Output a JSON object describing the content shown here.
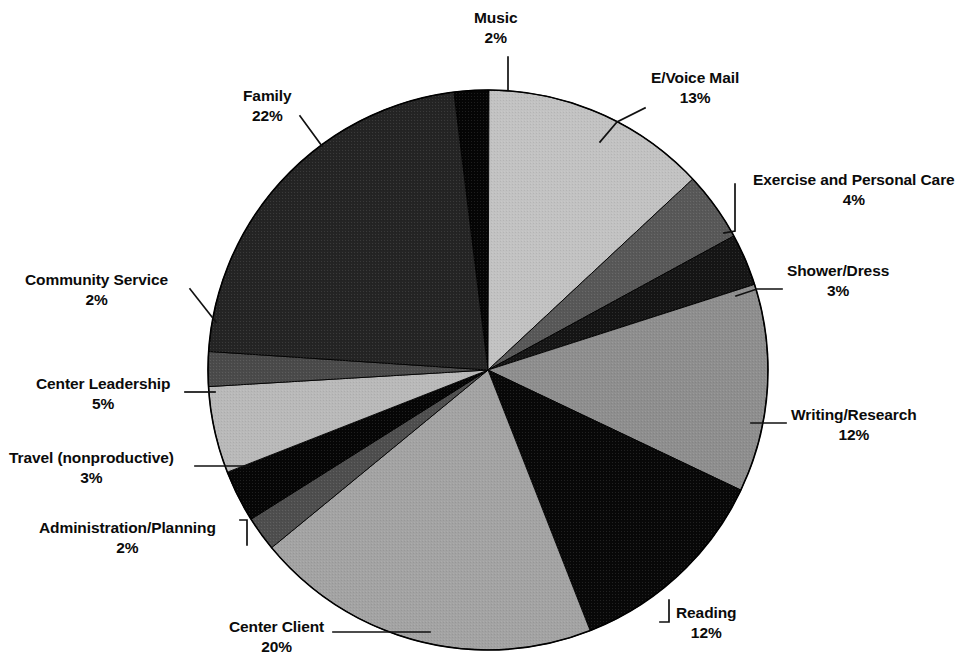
{
  "chart_data": {
    "type": "pie",
    "title": "",
    "subtitle": "",
    "xlabel": "",
    "ylabel": "",
    "legend_position": "none",
    "grid": false,
    "labels_show_percent": true,
    "total_percent": 100,
    "center": {
      "x": 488,
      "y": 370
    },
    "radius": 280,
    "start_angle_deg": -97,
    "direction": "clockwise",
    "categories": [
      "Music",
      "E/Voice Mail",
      "Exercise and Personal Care",
      "Shower/Dress",
      "Writing/Research",
      "Reading",
      "Center Client",
      "Administration/Planning",
      "Travel (nonproductive)",
      "Center Leadership",
      "Community Service",
      "Family"
    ],
    "values": [
      2,
      13,
      4,
      3,
      12,
      12,
      20,
      2,
      3,
      5,
      2,
      22
    ],
    "colors": [
      "#050505",
      "#c2c2c2",
      "#585858",
      "#151515",
      "#8e8e8e",
      "#080808",
      "#a3a3a3",
      "#4e4e4e",
      "#060606",
      "#b9b9b9",
      "#4a4a4a",
      "#242424"
    ],
    "slices": [
      {
        "label": "Music",
        "percent_text": "2%",
        "value": 2,
        "color": "#050505"
      },
      {
        "label": "E/Voice Mail",
        "percent_text": "13%",
        "value": 13,
        "color": "#c2c2c2"
      },
      {
        "label": "Exercise and Personal Care",
        "percent_text": "4%",
        "value": 4,
        "color": "#585858"
      },
      {
        "label": "Shower/Dress",
        "percent_text": "3%",
        "value": 3,
        "color": "#151515"
      },
      {
        "label": "Writing/Research",
        "percent_text": "12%",
        "value": 12,
        "color": "#8e8e8e"
      },
      {
        "label": "Reading",
        "percent_text": "12%",
        "value": 12,
        "color": "#080808"
      },
      {
        "label": "Center Client",
        "percent_text": "20%",
        "value": 20,
        "color": "#a3a3a3"
      },
      {
        "label": "Administration/Planning",
        "percent_text": "2%",
        "value": 2,
        "color": "#4e4e4e"
      },
      {
        "label": "Travel (nonproductive)",
        "percent_text": "3%",
        "value": 3,
        "color": "#060606"
      },
      {
        "label": "Center Leadership",
        "percent_text": "5%",
        "value": 5,
        "color": "#b9b9b9"
      },
      {
        "label": "Community Service",
        "percent_text": "2%",
        "value": 2,
        "color": "#4a4a4a"
      },
      {
        "label": "Family",
        "percent_text": "22%",
        "value": 22,
        "color": "#242424"
      }
    ]
  },
  "labels": {
    "music": {
      "name": "Music",
      "pct": "2%"
    },
    "evoice": {
      "name": "E/Voice Mail",
      "pct": "13%"
    },
    "exercise": {
      "name": "Exercise and Personal Care",
      "pct": "4%"
    },
    "shower": {
      "name": "Shower/Dress",
      "pct": "3%"
    },
    "writing": {
      "name": "Writing/Research",
      "pct": "12%"
    },
    "reading": {
      "name": "Reading",
      "pct": "12%"
    },
    "centerclient": {
      "name": "Center Client",
      "pct": "20%"
    },
    "admin": {
      "name": "Administration/Planning",
      "pct": "2%"
    },
    "travel": {
      "name": "Travel (nonproductive)",
      "pct": "3%"
    },
    "leadership": {
      "name": "Center Leadership",
      "pct": "5%"
    },
    "community": {
      "name": "Community Service",
      "pct": "2%"
    },
    "family": {
      "name": "Family",
      "pct": "22%"
    }
  },
  "style": {
    "background": "#ffffff",
    "text_color": "#0b0b0b",
    "leader_line_color": "#111111",
    "pie_outline_color": "#000000"
  }
}
